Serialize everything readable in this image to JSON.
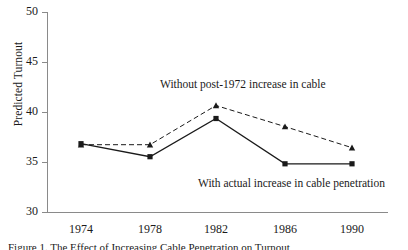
{
  "chart_data": {
    "type": "line",
    "title": "",
    "xlabel": "",
    "ylabel": "Predicted Turnout",
    "categories": [
      "1974",
      "1978",
      "1982",
      "1986",
      "1990"
    ],
    "x": [
      1974,
      1978,
      1982,
      1986,
      1990
    ],
    "ylim": [
      30,
      50
    ],
    "yticks": [
      30,
      35,
      40,
      45,
      50
    ],
    "ytick_labels": [
      "30",
      "35",
      "40",
      "45",
      "50"
    ],
    "grid": false,
    "legend_position": "inline-annotations",
    "series": [
      {
        "name": "Without post-1972 increase in cable",
        "style": "dashed",
        "marker": "triangle",
        "color": "#1a1a1a",
        "values": [
          36.8,
          36.8,
          40.7,
          38.6,
          36.5
        ]
      },
      {
        "name": "With actual increase in cable penetration",
        "style": "solid",
        "marker": "square",
        "color": "#1a1a1a",
        "values": [
          36.9,
          35.6,
          39.4,
          34.9,
          34.9
        ]
      }
    ],
    "annotations": [
      {
        "id": "dashed-series-label",
        "text": "Without post-1972 increase in cable"
      },
      {
        "id": "solid-series-label",
        "text": "With actual increase in cable penetration"
      }
    ]
  },
  "axis": {
    "y_title": "Predicted Turnout",
    "y_tick_labels": [
      "50",
      "45",
      "40",
      "35",
      "30"
    ],
    "x_tick_labels": [
      "1974",
      "1978",
      "1982",
      "1986",
      "1990"
    ]
  },
  "annotations": {
    "dashed_label": "Without post-1972 increase in cable",
    "solid_label": "With actual increase in cable penetration"
  },
  "caption": {
    "text": "Figure 1.  The Effect of Increasing Cable Penetration on Turnout"
  }
}
